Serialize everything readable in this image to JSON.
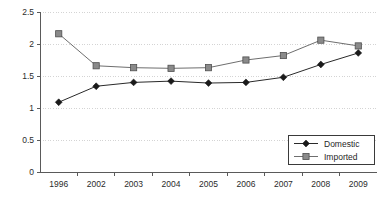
{
  "chart_data": {
    "type": "line",
    "title": "",
    "xlabel": "",
    "ylabel": "",
    "categories": [
      "1996",
      "2002",
      "2003",
      "2004",
      "2005",
      "2006",
      "2007",
      "2008",
      "2009"
    ],
    "series": [
      {
        "name": "Domestic",
        "marker": "diamond",
        "color": "#1a1a1a",
        "values": [
          1.09,
          1.34,
          1.4,
          1.42,
          1.39,
          1.4,
          1.48,
          1.68,
          1.86
        ]
      },
      {
        "name": "Imported",
        "marker": "square",
        "color": "#8a8a8a",
        "values": [
          2.16,
          1.66,
          1.63,
          1.62,
          1.63,
          1.75,
          1.82,
          2.06,
          1.97
        ]
      }
    ],
    "ylim": [
      0,
      2.5
    ],
    "yticks": [
      0,
      0.5,
      1,
      1.5,
      2,
      2.5
    ],
    "ytick_labels": [
      "0",
      "0.5",
      "1",
      "1.5",
      "2",
      "2.5"
    ],
    "grid": true,
    "grid_axis": "y",
    "legend_position": "bottom-right",
    "legend_entries": [
      "Domestic",
      "Imported"
    ]
  }
}
